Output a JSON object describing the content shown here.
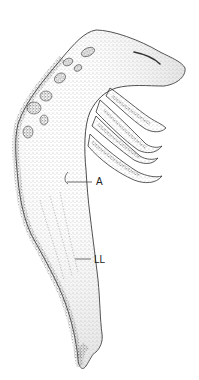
{
  "figure": {
    "labels": [
      {
        "id": "a",
        "text": "A"
      },
      {
        "id": "ll",
        "text": "LL"
      }
    ],
    "colors": {
      "ink": "#222222",
      "background": "#ffffff",
      "stipple_dark": "#555555",
      "stipple_light": "#bbbbbb"
    }
  }
}
